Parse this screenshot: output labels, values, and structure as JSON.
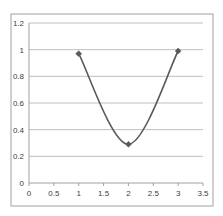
{
  "chart_data": {
    "type": "scatter",
    "subtype": "smooth-line-with-markers",
    "title": "",
    "xlabel": "",
    "ylabel": "",
    "xlim": [
      0,
      3.5
    ],
    "ylim": [
      0,
      1.2
    ],
    "x_ticks": [
      "0",
      "0.5",
      "1",
      "1.5",
      "2",
      "2.5",
      "3",
      "3.5"
    ],
    "y_ticks": [
      "0",
      "0.2",
      "0.4",
      "0.6",
      "0.8",
      "1",
      "1.2"
    ],
    "grid": {
      "horizontal": true,
      "vertical": false
    },
    "legend": null,
    "series": [
      {
        "name": "Series1",
        "x": [
          1,
          2,
          3
        ],
        "y": [
          0.97,
          0.29,
          0.99
        ],
        "color": "#5a5a5a",
        "marker": "diamond"
      }
    ]
  },
  "colors": {
    "line": "#5a5a5a",
    "gridline": "#bfbfbf",
    "border": "#a0a0a0",
    "tick_text": "#404040"
  }
}
